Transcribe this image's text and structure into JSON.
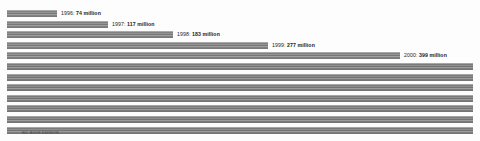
{
  "chart_data": {
    "type": "bar",
    "orientation": "horizontal",
    "title": "",
    "subtitle": "",
    "xlabel": "",
    "ylabel": "",
    "grid": false,
    "legend": null,
    "axis_visible": false,
    "unit": "million",
    "xlim": [
      0,
      480
    ],
    "categories": [
      "1996",
      "1997",
      "1998",
      "1999",
      "2000",
      "",
      "",
      "",
      "",
      "",
      "",
      ""
    ],
    "values": [
      74,
      117,
      183,
      277,
      399,
      null,
      null,
      null,
      null,
      null,
      null,
      null
    ],
    "bars": [
      {
        "category": "1996",
        "value": 74,
        "value_text": "74 million",
        "label": "1996:",
        "label_text": "1996:  74 million",
        "labeled": true,
        "pixel_width": 50
      },
      {
        "category": "1997",
        "value": 117,
        "value_text": "117 million",
        "label": "1997:",
        "label_text": "1997:  117 million",
        "labeled": true,
        "pixel_width": 101
      },
      {
        "category": "1998",
        "value": 183,
        "value_text": "183 million",
        "label": "1998:",
        "label_text": "1998:  183 million",
        "labeled": true,
        "pixel_width": 166
      },
      {
        "category": "1999",
        "value": 277,
        "value_text": "277 million",
        "label": "1999:",
        "label_text": "1999:  277 million",
        "labeled": true,
        "pixel_width": 261
      },
      {
        "category": "2000",
        "value": 399,
        "value_text": "399 million",
        "label": "2000:",
        "label_text": "2000:  399 million",
        "labeled": true,
        "pixel_width": 393
      },
      {
        "category": "",
        "value": null,
        "value_text": "",
        "label": "",
        "label_text": "",
        "labeled": false,
        "pixel_width": 466
      },
      {
        "category": "",
        "value": null,
        "value_text": "",
        "label": "",
        "label_text": "",
        "labeled": false,
        "pixel_width": 466
      },
      {
        "category": "",
        "value": null,
        "value_text": "",
        "label": "",
        "label_text": "",
        "labeled": false,
        "pixel_width": 466
      },
      {
        "category": "",
        "value": null,
        "value_text": "",
        "label": "",
        "label_text": "",
        "labeled": false,
        "pixel_width": 466
      },
      {
        "category": "",
        "value": null,
        "value_text": "",
        "label": "",
        "label_text": "",
        "labeled": false,
        "pixel_width": 466
      },
      {
        "category": "",
        "value": null,
        "value_text": "",
        "label": "",
        "label_text": "",
        "labeled": false,
        "pixel_width": 466
      },
      {
        "category": "",
        "value": null,
        "value_text": "",
        "label": "",
        "label_text": "",
        "labeled": false,
        "pixel_width": 466
      }
    ],
    "colors": {
      "bar": "#8e8e8e",
      "bar_full": "#898989",
      "background": "#fdfdfd",
      "label_text": "#1b1b1b",
      "footnote_text": "#3a3a3a"
    }
  },
  "footnote": {
    "text": "NO. BOOK DIVISION"
  }
}
